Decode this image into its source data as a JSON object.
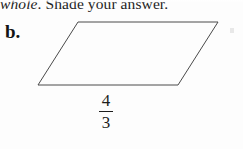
{
  "page": {
    "width": 243,
    "height": 149,
    "background_color": "#fdfdfd",
    "ink_color": "#1a1a1a"
  },
  "instruction": {
    "italic_text": "whole",
    "roman_text": ". Shade your answer.",
    "full_text": "whole. Shade your answer.",
    "clipped_at_top": true
  },
  "problem": {
    "letter": "b."
  },
  "figure": {
    "shape_name": "parallelogram",
    "stroke_color": "#4a4a4a",
    "fill_color": "none",
    "stroke_width": 1,
    "vertices": [
      {
        "name": "top-left",
        "x": 78,
        "y": 22
      },
      {
        "name": "top-right",
        "x": 218,
        "y": 22
      },
      {
        "name": "bottom-right",
        "x": 178,
        "y": 85
      },
      {
        "name": "bottom-left",
        "x": 38,
        "y": 85
      }
    ],
    "points_attr": "78,22 218,22 178,85 38,85"
  },
  "base_label": {
    "numerator": "4",
    "denominator": "3",
    "value": "4/3"
  },
  "artifact": {
    "description": "faint scan speck",
    "color": "#e8e8e8"
  }
}
